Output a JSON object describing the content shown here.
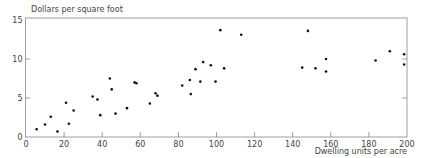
{
  "chart_data": {
    "type": "scatter",
    "title": "",
    "ylabel": "Dollars per square foot",
    "xlabel": "Dwelling units per acre",
    "xlim": [
      0,
      200
    ],
    "ylim": [
      0,
      15
    ],
    "grid": false,
    "legend": null,
    "x_ticks": [
      0,
      20,
      40,
      60,
      80,
      100,
      120,
      140,
      160,
      180,
      200
    ],
    "x_tick_labels": [
      "0",
      "20",
      "40",
      "60",
      "80",
      "100",
      "120",
      "140",
      "160",
      "180",
      "200"
    ],
    "y_ticks": [
      0,
      5,
      10,
      15
    ],
    "y_tick_labels": [
      "0",
      "5",
      "10",
      "15"
    ],
    "series": [
      {
        "name": "observations",
        "points": [
          [
            5.6,
            1.0
          ],
          [
            10,
            1.6
          ],
          [
            13,
            2.6
          ],
          [
            16.5,
            0.7
          ],
          [
            21,
            4.4
          ],
          [
            22.5,
            1.7
          ],
          [
            25,
            3.4
          ],
          [
            35,
            5.2
          ],
          [
            37.5,
            4.8
          ],
          [
            39,
            2.8
          ],
          [
            44,
            7.5
          ],
          [
            45,
            6.1
          ],
          [
            47,
            3.0
          ],
          [
            53,
            3.7
          ],
          [
            57,
            7.0
          ],
          [
            58,
            6.9
          ],
          [
            65,
            4.3
          ],
          [
            68,
            5.6
          ],
          [
            69,
            5.3
          ],
          [
            82,
            6.6
          ],
          [
            86,
            7.3
          ],
          [
            86.5,
            5.5
          ],
          [
            89,
            8.7
          ],
          [
            91.5,
            7.1
          ],
          [
            93,
            9.6
          ],
          [
            97,
            9.2
          ],
          [
            99.5,
            7.1
          ],
          [
            102,
            13.7
          ],
          [
            104,
            8.8
          ],
          [
            113,
            13.1
          ],
          [
            145,
            8.9
          ],
          [
            148,
            13.6
          ],
          [
            152,
            8.8
          ],
          [
            157.5,
            10.0
          ],
          [
            157.5,
            8.4
          ],
          [
            183.5,
            9.8
          ],
          [
            191,
            11.0
          ],
          [
            198.5,
            10.6
          ],
          [
            198.5,
            9.3
          ]
        ]
      }
    ]
  },
  "colors": {
    "axis": "#888888",
    "point": "#111111",
    "text": "#444444"
  }
}
